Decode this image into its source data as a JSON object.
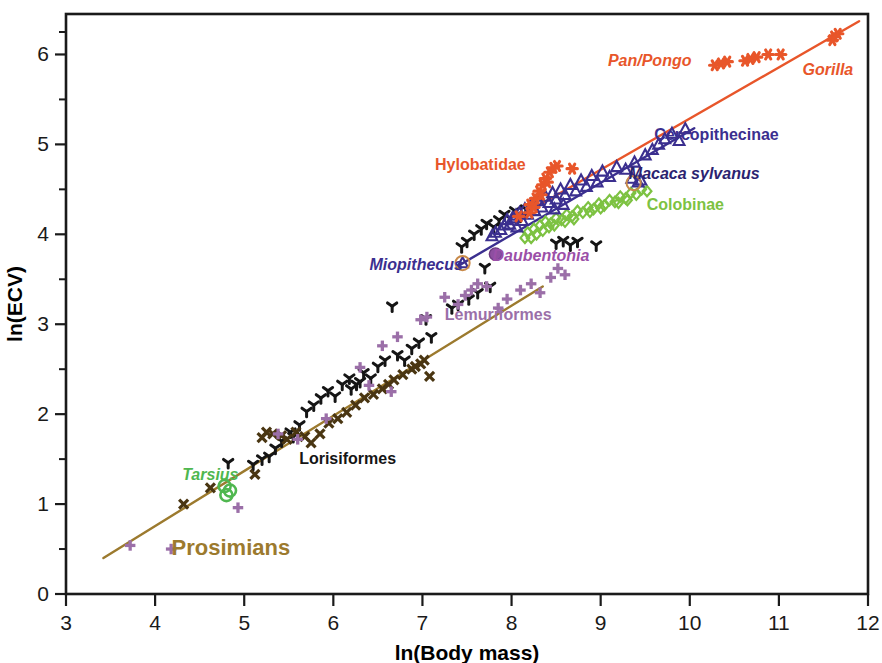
{
  "figure": {
    "width": 882,
    "height": 663,
    "background": "#ffffff"
  },
  "chart_data": {
    "type": "scatter",
    "title": "",
    "xlabel": "ln(Body mass)",
    "ylabel": "ln(ECV)",
    "xlim": [
      3,
      12
    ],
    "ylim": [
      0,
      6.45
    ],
    "xticks": [
      "3",
      "4",
      "5",
      "6",
      "7",
      "8",
      "9",
      "10",
      "11",
      "12"
    ],
    "yticks": [
      "0",
      "1",
      "2",
      "3",
      "4",
      "5",
      "6"
    ],
    "xtick_values": [
      3,
      4,
      5,
      6,
      7,
      8,
      9,
      10,
      11,
      12
    ],
    "ytick_values": [
      0,
      1,
      2,
      3,
      4,
      5,
      6
    ],
    "y_minor_ticks": [
      0.5,
      1.5,
      2.5,
      3.5,
      4.5,
      5.5,
      6.25
    ],
    "grid": false,
    "legend_position": "inline-annotations",
    "colors": {
      "hominoid_orange": "#E8562A",
      "cercopithecine_navy": "#3B2F8F",
      "colobine_green": "#7DC242",
      "prosimian_brown": "#9C7A2E",
      "lemuriform_purple": "#9B6FA8",
      "lorisiform_black": "#151515",
      "tarsius_green": "#4FB74F",
      "daubentonia_purple": "#8E4FA0",
      "axis_black": "#1a1a1a"
    },
    "annotations": [
      {
        "text": "Pan/Pongo",
        "x": 9.55,
        "y": 5.87,
        "color": "#E8562A",
        "italic": true,
        "size": 16,
        "anchor": "middle"
      },
      {
        "text": "Gorilla",
        "x": 11.55,
        "y": 5.77,
        "color": "#E8562A",
        "italic": true,
        "size": 16,
        "anchor": "middle"
      },
      {
        "text": "Cercopithecinae",
        "x": 10.3,
        "y": 5.05,
        "color": "#3B2F8F",
        "italic": false,
        "size": 16,
        "anchor": "middle"
      },
      {
        "text": "Macaca sylvanus",
        "x": 10.05,
        "y": 4.62,
        "color": "#2B2370",
        "italic": true,
        "size": 16,
        "anchor": "middle"
      },
      {
        "text": "Colobinae",
        "x": 9.95,
        "y": 4.27,
        "color": "#7DC242",
        "italic": false,
        "size": 16,
        "anchor": "middle"
      },
      {
        "text": "Hylobatidae",
        "x": 7.65,
        "y": 4.72,
        "color": "#E8562A",
        "italic": false,
        "size": 16,
        "anchor": "middle"
      },
      {
        "text": "Miopithecus",
        "x": 6.93,
        "y": 3.6,
        "color": "#3B2F8F",
        "italic": true,
        "size": 16,
        "anchor": "middle"
      },
      {
        "text": "Daubentonia",
        "x": 8.33,
        "y": 3.7,
        "color": "#9B4FA8",
        "italic": true,
        "size": 16,
        "anchor": "middle"
      },
      {
        "text": "Lemuriformes",
        "x": 7.85,
        "y": 3.05,
        "color": "#9B6FA8",
        "italic": false,
        "size": 16,
        "anchor": "middle"
      },
      {
        "text": "Lorisiformes",
        "x": 6.16,
        "y": 1.45,
        "color": "#151515",
        "italic": false,
        "size": 16,
        "anchor": "middle"
      },
      {
        "text": "Tarsius",
        "x": 4.62,
        "y": 1.27,
        "color": "#4FB74F",
        "italic": true,
        "size": 16,
        "anchor": "middle"
      },
      {
        "text": "Prosimians",
        "x": 4.85,
        "y": 0.43,
        "color": "#9C7A2E",
        "italic": false,
        "size": 22,
        "anchor": "middle"
      }
    ],
    "trend_lines": [
      {
        "name": "hominoid",
        "color": "#E8562A",
        "width": 2.4,
        "x1": 8.18,
        "y1": 4.25,
        "x2": 11.9,
        "y2": 6.37
      },
      {
        "name": "cercopithecoid",
        "color": "#3B2F8F",
        "width": 2.4,
        "x1": 7.42,
        "y1": 3.66,
        "x2": 10.05,
        "y2": 5.18
      },
      {
        "name": "prosimian",
        "color": "#9C7A2E",
        "width": 2.4,
        "x1": 3.42,
        "y1": 0.4,
        "x2": 8.35,
        "y2": 3.42
      }
    ],
    "series": [
      {
        "name": "Hominoidea",
        "marker": "asterisk",
        "color": "#E8562A",
        "size": 9,
        "points": [
          [
            8.21,
            4.33
          ],
          [
            8.27,
            4.4
          ],
          [
            8.31,
            4.48
          ],
          [
            8.35,
            4.55
          ],
          [
            8.38,
            4.62
          ],
          [
            8.43,
            4.69
          ],
          [
            8.47,
            4.74
          ],
          [
            8.2,
            4.24
          ],
          [
            8.25,
            4.3
          ],
          [
            8.33,
            4.44
          ],
          [
            8.4,
            4.58
          ],
          [
            8.51,
            4.76
          ],
          [
            8.08,
            4.2
          ],
          [
            8.68,
            4.73
          ],
          [
            10.28,
            5.88
          ],
          [
            10.42,
            5.92
          ],
          [
            10.62,
            5.93
          ],
          [
            10.75,
            5.97
          ],
          [
            10.88,
            6.0
          ],
          [
            11.02,
            6.0
          ],
          [
            11.62,
            6.2
          ],
          [
            11.66,
            6.23
          ],
          [
            11.6,
            6.16
          ],
          [
            10.35,
            5.9
          ],
          [
            10.68,
            5.95
          ]
        ]
      },
      {
        "name": "Cercopithecinae",
        "marker": "triangle",
        "color": "#3B2F8F",
        "size": 9,
        "points": [
          [
            7.45,
            3.68
          ],
          [
            7.88,
            4.05
          ],
          [
            7.92,
            4.1
          ],
          [
            7.95,
            4.16
          ],
          [
            7.98,
            4.11
          ],
          [
            8.01,
            4.18
          ],
          [
            8.05,
            4.21
          ],
          [
            8.09,
            4.24
          ],
          [
            8.12,
            4.15
          ],
          [
            8.15,
            4.28
          ],
          [
            8.18,
            4.22
          ],
          [
            8.22,
            4.33
          ],
          [
            8.26,
            4.26
          ],
          [
            8.3,
            4.37
          ],
          [
            8.34,
            4.3
          ],
          [
            8.38,
            4.42
          ],
          [
            8.42,
            4.35
          ],
          [
            8.46,
            4.46
          ],
          [
            8.5,
            4.39
          ],
          [
            8.55,
            4.5
          ],
          [
            8.6,
            4.44
          ],
          [
            8.66,
            4.55
          ],
          [
            8.72,
            4.48
          ],
          [
            8.78,
            4.6
          ],
          [
            8.84,
            4.53
          ],
          [
            8.9,
            4.65
          ],
          [
            8.96,
            4.58
          ],
          [
            9.02,
            4.7
          ],
          [
            9.1,
            4.64
          ],
          [
            9.18,
            4.75
          ],
          [
            9.28,
            4.72
          ],
          [
            9.38,
            4.8
          ],
          [
            9.45,
            4.6
          ],
          [
            9.5,
            4.88
          ],
          [
            9.58,
            4.94
          ],
          [
            9.65,
            5.0
          ],
          [
            9.72,
            5.06
          ],
          [
            9.8,
            5.12
          ],
          [
            9.88,
            5.04
          ],
          [
            9.95,
            5.17
          ],
          [
            7.78,
            3.98
          ],
          [
            7.82,
            4.02
          ],
          [
            8.06,
            4.08
          ],
          [
            8.48,
            4.28
          ],
          [
            8.58,
            4.33
          ],
          [
            9.35,
            4.62
          ],
          [
            9.42,
            4.58
          ]
        ]
      },
      {
        "name": "Colobinae",
        "marker": "diamond",
        "color": "#7DC242",
        "size": 9,
        "points": [
          [
            8.18,
            4.02
          ],
          [
            8.25,
            4.06
          ],
          [
            8.32,
            4.1
          ],
          [
            8.38,
            4.14
          ],
          [
            8.44,
            4.12
          ],
          [
            8.5,
            4.18
          ],
          [
            8.56,
            4.16
          ],
          [
            8.62,
            4.22
          ],
          [
            8.68,
            4.2
          ],
          [
            8.74,
            4.26
          ],
          [
            8.8,
            4.24
          ],
          [
            8.86,
            4.3
          ],
          [
            8.92,
            4.28
          ],
          [
            8.98,
            4.34
          ],
          [
            9.04,
            4.32
          ],
          [
            9.1,
            4.38
          ],
          [
            9.16,
            4.36
          ],
          [
            9.22,
            4.42
          ],
          [
            9.28,
            4.4
          ],
          [
            9.34,
            4.46
          ],
          [
            9.4,
            4.44
          ],
          [
            9.46,
            4.5
          ],
          [
            9.52,
            4.48
          ],
          [
            8.28,
            4.0
          ],
          [
            8.35,
            4.04
          ],
          [
            8.42,
            4.08
          ],
          [
            8.6,
            4.14
          ],
          [
            8.7,
            4.17
          ],
          [
            8.88,
            4.25
          ],
          [
            9.0,
            4.29
          ],
          [
            9.2,
            4.35
          ],
          [
            9.3,
            4.38
          ],
          [
            8.22,
            3.96
          ],
          [
            8.15,
            3.96
          ],
          [
            8.48,
            4.1
          ]
        ]
      },
      {
        "name": "Lorisiformes",
        "marker": "y-shape",
        "color": "#151515",
        "size": 9,
        "points": [
          [
            4.82,
            1.46
          ],
          [
            5.28,
            1.53
          ],
          [
            5.42,
            1.7
          ],
          [
            5.52,
            1.8
          ],
          [
            5.62,
            1.88
          ],
          [
            5.7,
            2.03
          ],
          [
            5.78,
            2.1
          ],
          [
            5.86,
            2.18
          ],
          [
            5.94,
            2.26
          ],
          [
            6.02,
            2.2
          ],
          [
            6.1,
            2.33
          ],
          [
            6.18,
            2.4
          ],
          [
            6.26,
            2.33
          ],
          [
            6.34,
            2.46
          ],
          [
            6.42,
            2.4
          ],
          [
            6.5,
            2.53
          ],
          [
            6.58,
            2.6
          ],
          [
            6.66,
            3.2
          ],
          [
            6.72,
            2.66
          ],
          [
            6.8,
            2.6
          ],
          [
            6.88,
            2.73
          ],
          [
            6.96,
            2.8
          ],
          [
            7.04,
            3.06
          ],
          [
            7.1,
            2.86
          ],
          [
            7.52,
            3.28
          ],
          [
            7.62,
            3.35
          ],
          [
            7.7,
            3.63
          ],
          [
            7.76,
            3.42
          ],
          [
            7.4,
            3.22
          ],
          [
            7.33,
            3.18
          ],
          [
            7.58,
            4.0
          ],
          [
            7.66,
            4.06
          ],
          [
            7.72,
            4.12
          ],
          [
            7.8,
            4.08
          ],
          [
            7.86,
            4.16
          ],
          [
            7.92,
            4.22
          ],
          [
            7.98,
            4.18
          ],
          [
            8.04,
            4.26
          ],
          [
            8.1,
            4.2
          ],
          [
            8.16,
            4.28
          ],
          [
            7.5,
            3.92
          ],
          [
            7.44,
            3.86
          ],
          [
            8.5,
            3.9
          ],
          [
            8.58,
            3.93
          ],
          [
            8.66,
            3.88
          ],
          [
            8.74,
            3.92
          ],
          [
            8.95,
            3.88
          ],
          [
            5.2,
            1.5
          ],
          [
            5.1,
            1.44
          ],
          [
            6.2,
            2.28
          ],
          [
            6.3,
            2.36
          ],
          [
            5.55,
            1.75
          ],
          [
            5.35,
            1.62
          ]
        ]
      },
      {
        "name": "Lemuriformes",
        "marker": "plus",
        "color": "#9B6FA8",
        "size": 10,
        "points": [
          [
            3.72,
            0.54
          ],
          [
            4.18,
            0.5
          ],
          [
            4.93,
            0.96
          ],
          [
            5.38,
            1.78
          ],
          [
            5.6,
            1.72
          ],
          [
            5.92,
            1.95
          ],
          [
            6.4,
            2.32
          ],
          [
            6.65,
            2.25
          ],
          [
            6.98,
            3.05
          ],
          [
            7.05,
            3.08
          ],
          [
            7.25,
            3.3
          ],
          [
            7.4,
            3.22
          ],
          [
            7.55,
            3.38
          ],
          [
            7.62,
            3.45
          ],
          [
            7.72,
            3.42
          ],
          [
            7.95,
            3.28
          ],
          [
            8.1,
            3.38
          ],
          [
            8.22,
            3.45
          ],
          [
            8.32,
            3.35
          ],
          [
            8.44,
            3.52
          ],
          [
            8.52,
            3.62
          ],
          [
            7.85,
            3.18
          ],
          [
            7.48,
            3.32
          ],
          [
            8.6,
            3.55
          ],
          [
            6.72,
            2.86
          ],
          [
            6.55,
            2.76
          ],
          [
            6.3,
            2.52
          ]
        ]
      },
      {
        "name": "Prosimian-X",
        "marker": "x-shape",
        "color": "#4A3612",
        "size": 9,
        "points": [
          [
            4.32,
            1.0
          ],
          [
            4.62,
            1.18
          ],
          [
            5.12,
            1.33
          ],
          [
            5.25,
            1.8
          ],
          [
            5.32,
            1.78
          ],
          [
            5.48,
            1.72
          ],
          [
            5.58,
            1.8
          ],
          [
            5.68,
            1.75
          ],
          [
            5.75,
            1.68
          ],
          [
            5.85,
            1.78
          ],
          [
            5.95,
            1.9
          ],
          [
            6.05,
            1.95
          ],
          [
            6.15,
            2.02
          ],
          [
            6.25,
            2.1
          ],
          [
            6.35,
            2.18
          ],
          [
            6.45,
            2.22
          ],
          [
            6.55,
            2.28
          ],
          [
            6.68,
            2.38
          ],
          [
            6.78,
            2.44
          ],
          [
            6.88,
            2.5
          ],
          [
            6.98,
            2.56
          ],
          [
            7.08,
            2.42
          ],
          [
            5.2,
            1.74
          ],
          [
            5.42,
            1.76
          ],
          [
            6.62,
            2.33
          ],
          [
            6.92,
            2.53
          ],
          [
            7.02,
            2.6
          ]
        ]
      },
      {
        "name": "Tarsius",
        "marker": "circle-open",
        "color": "#4FB74F",
        "size": 11,
        "points": [
          [
            4.78,
            1.2
          ],
          [
            4.84,
            1.15
          ],
          [
            4.8,
            1.1
          ]
        ]
      },
      {
        "name": "Daubentonia",
        "marker": "circle-filled",
        "color": "#8E4FA0",
        "size": 13,
        "points": [
          [
            7.82,
            3.78
          ]
        ]
      },
      {
        "name": "Miopithecus-highlight",
        "marker": "circle-outline-highlight",
        "color": "#C88A4A",
        "size": 15,
        "points": [
          [
            7.45,
            3.68
          ]
        ]
      },
      {
        "name": "Macaca-sylvanus-highlight",
        "marker": "circle-outline-highlight",
        "color": "#C88A4A",
        "size": 15,
        "points": [
          [
            9.37,
            4.57
          ]
        ]
      }
    ]
  }
}
